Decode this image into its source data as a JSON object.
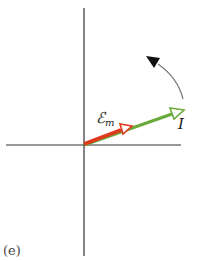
{
  "diagram": {
    "panel_label": "(e)",
    "type": "phasor-diagram",
    "axes": {
      "color": "#333333",
      "origin": [
        84,
        145
      ]
    },
    "vectors": [
      {
        "name": "emf",
        "label_main": "ℰ",
        "label_sub": "m",
        "color": "#e03a1e",
        "from": [
          84,
          145
        ],
        "to": [
          131,
          127
        ]
      },
      {
        "name": "current",
        "label_main": "I",
        "label_sub": "",
        "color": "#6aaa3a",
        "from": [
          84,
          145
        ],
        "to": [
          183,
          110
        ]
      }
    ],
    "rotation_arrow": {
      "direction": "counterclockwise",
      "color": "#222222"
    }
  }
}
